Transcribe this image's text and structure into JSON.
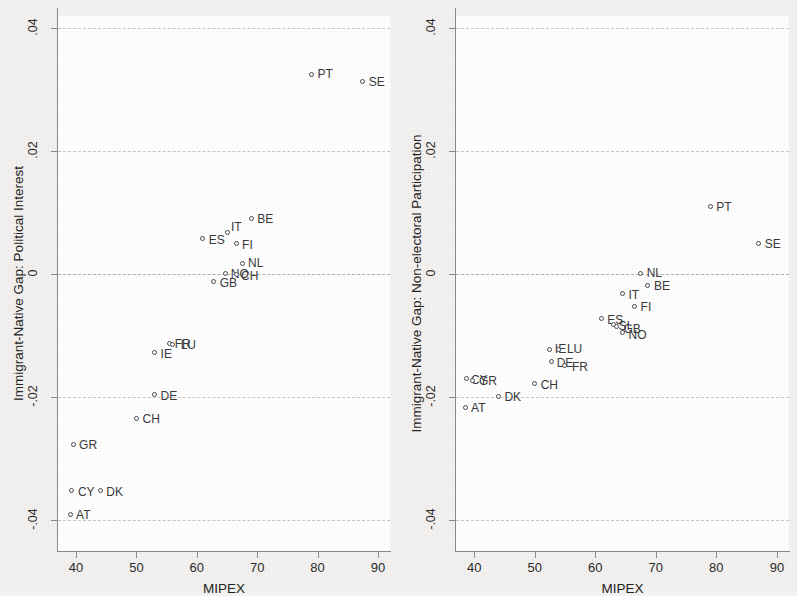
{
  "figure": {
    "background_color": "#f2f1ef",
    "plot_background_color": "#fefefe",
    "marker_color": "#4a4a52",
    "grid_color": "#c9c9c9"
  },
  "chart_data": [
    {
      "type": "scatter",
      "panel": "left",
      "title": "",
      "xlabel": "MIPEX",
      "ylabel": "Immigrant-Native Gap: Political Interest",
      "xlim": [
        37,
        92
      ],
      "ylim": [
        -0.045,
        0.042
      ],
      "xticks": [
        40,
        50,
        60,
        70,
        80,
        90
      ],
      "xticklabels": [
        "40",
        "50",
        "60",
        "70",
        "80",
        "90"
      ],
      "yticks": [
        -0.04,
        -0.02,
        0,
        0.02,
        0.04
      ],
      "yticklabels": [
        "-.04",
        "-.02",
        "0",
        ".02",
        ".04"
      ],
      "grid": true,
      "zero_line": true,
      "points": [
        {
          "label": "PT",
          "x": 79.0,
          "y": 0.0325,
          "lx": 6,
          "ly": -6
        },
        {
          "label": "SE",
          "x": 87.5,
          "y": 0.0313,
          "lx": 6,
          "ly": -6
        },
        {
          "label": "BE",
          "x": 69.0,
          "y": 0.009,
          "lx": 6,
          "ly": -6
        },
        {
          "label": "IT",
          "x": 65.0,
          "y": 0.0068,
          "lx": 4,
          "ly": -11
        },
        {
          "label": "ES",
          "x": 61.0,
          "y": 0.0058,
          "lx": 6,
          "ly": -5
        },
        {
          "label": "FI",
          "x": 66.5,
          "y": 0.005,
          "lx": 6,
          "ly": -5
        },
        {
          "label": "NL",
          "x": 67.5,
          "y": 0.0018,
          "lx": 6,
          "ly": -6
        },
        {
          "label": "NO",
          "x": 64.8,
          "y": 0.0002,
          "lx": 5,
          "ly": -5
        },
        {
          "label": "CH",
          "x": 66.5,
          "y": 0.0,
          "lx": 5,
          "ly": -4
        },
        {
          "label": "GB",
          "x": 62.8,
          "y": -0.0012,
          "lx": 6,
          "ly": -5
        },
        {
          "label": "FR",
          "x": 55.5,
          "y": -0.0113,
          "lx": 5,
          "ly": -6
        },
        {
          "label": "LU",
          "x": 56.0,
          "y": -0.0115,
          "lx": 8,
          "ly": -6
        },
        {
          "label": "IE",
          "x": 53.0,
          "y": -0.0127,
          "lx": 6,
          "ly": -4
        },
        {
          "label": "DE",
          "x": 53.0,
          "y": -0.0196,
          "lx": 6,
          "ly": -5
        },
        {
          "label": "CH",
          "x": 50.0,
          "y": -0.0234,
          "lx": 6,
          "ly": -5
        },
        {
          "label": "GR",
          "x": 39.5,
          "y": -0.0276,
          "lx": 6,
          "ly": -5
        },
        {
          "label": "CY",
          "x": 39.3,
          "y": -0.0352,
          "lx": 6,
          "ly": -5
        },
        {
          "label": "DK",
          "x": 44.0,
          "y": -0.0352,
          "lx": 6,
          "ly": -5
        },
        {
          "label": "AT",
          "x": 39.0,
          "y": -0.039,
          "lx": 6,
          "ly": -5
        }
      ]
    },
    {
      "type": "scatter",
      "panel": "right",
      "title": "",
      "xlabel": "MIPEX",
      "ylabel": "Immigrant-Native Gap: Non-electoral Participation",
      "xlim": [
        37,
        92
      ],
      "ylim": [
        -0.045,
        0.042
      ],
      "xticks": [
        40,
        50,
        60,
        70,
        80,
        90
      ],
      "xticklabels": [
        "40",
        "50",
        "60",
        "70",
        "80",
        "90"
      ],
      "yticks": [
        -0.04,
        -0.02,
        0,
        0.02,
        0.04
      ],
      "yticklabels": [
        "-.04",
        "-.02",
        "0",
        ".02",
        ".04"
      ],
      "grid": true,
      "zero_line": true,
      "points": [
        {
          "label": "PT",
          "x": 79.0,
          "y": 0.011,
          "lx": 6,
          "ly": -6
        },
        {
          "label": "SE",
          "x": 87.0,
          "y": 0.005,
          "lx": 6,
          "ly": -6
        },
        {
          "label": "NL",
          "x": 67.5,
          "y": 0.0002,
          "lx": 6,
          "ly": -6
        },
        {
          "label": "BE",
          "x": 68.7,
          "y": -0.0018,
          "lx": 6,
          "ly": -5
        },
        {
          "label": "IT",
          "x": 64.5,
          "y": -0.0032,
          "lx": 6,
          "ly": -5
        },
        {
          "label": "FI",
          "x": 66.5,
          "y": -0.0052,
          "lx": 6,
          "ly": -5
        },
        {
          "label": "ES",
          "x": 61.0,
          "y": -0.0072,
          "lx": 6,
          "ly": -5
        },
        {
          "label": "SI",
          "x": 63.0,
          "y": -0.0082,
          "lx": 5,
          "ly": -5
        },
        {
          "label": "GB",
          "x": 63.5,
          "y": -0.0085,
          "lx": 7,
          "ly": -4
        },
        {
          "label": "NO",
          "x": 64.5,
          "y": -0.0095,
          "lx": 6,
          "ly": -4
        },
        {
          "label": "IE",
          "x": 52.5,
          "y": -0.0122,
          "lx": 5,
          "ly": -6
        },
        {
          "label": "LU",
          "x": 54.0,
          "y": -0.0122,
          "lx": 8,
          "ly": -6
        },
        {
          "label": "DE",
          "x": 52.8,
          "y": -0.0142,
          "lx": 5,
          "ly": -5
        },
        {
          "label": "FR",
          "x": 55.0,
          "y": -0.0148,
          "lx": 7,
          "ly": -4
        },
        {
          "label": "CY",
          "x": 38.8,
          "y": -0.017,
          "lx": 4,
          "ly": -5
        },
        {
          "label": "GR",
          "x": 39.8,
          "y": -0.0172,
          "lx": 6,
          "ly": -5
        },
        {
          "label": "CH",
          "x": 50.0,
          "y": -0.0178,
          "lx": 6,
          "ly": -5
        },
        {
          "label": "DK",
          "x": 44.0,
          "y": -0.0198,
          "lx": 6,
          "ly": -5
        },
        {
          "label": "AT",
          "x": 38.5,
          "y": -0.0216,
          "lx": 6,
          "ly": -5
        }
      ]
    }
  ]
}
